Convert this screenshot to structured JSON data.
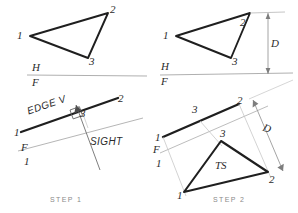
{
  "sheet": {
    "title": "Descriptive geometry construction — true size of an oblique plane",
    "ink_dark": "#1f1f1f",
    "ink_light": "#b6b6b6",
    "ink_label": "#2b2b2b",
    "step_label_color": "#8a8a8a",
    "background": "#ffffff"
  },
  "views": {
    "top_left": {
      "name": "Given top view",
      "vertices": [
        {
          "label": "1",
          "x": 30,
          "y": 36
        },
        {
          "label": "2",
          "x": 108,
          "y": 13
        },
        {
          "label": "3",
          "x": 88,
          "y": 58
        }
      ],
      "fold_line": {
        "label_upper": "H",
        "label_lower": "F"
      }
    },
    "top_right": {
      "name": "Given top view with depth dimension",
      "vertices": [
        {
          "label": "1",
          "x": 176,
          "y": 36
        },
        {
          "label": "2",
          "x": 250,
          "y": 13
        },
        {
          "label": "3",
          "x": 231,
          "y": 58
        }
      ],
      "fold_line": {
        "label_upper": "H",
        "label_lower": "F"
      },
      "dimension": {
        "label": "D",
        "meaning": "depth"
      }
    },
    "bottom_left": {
      "name": "Step 1 — edge view auxiliary",
      "step_label": "STEP 1",
      "annotations": [
        {
          "label": "EDGE V",
          "meaning": "edge view of the plane"
        },
        {
          "label": "SIGHT",
          "meaning": "line of sight direction"
        }
      ],
      "vertices": [
        {
          "label": "1",
          "x": 21,
          "y": 132
        },
        {
          "label": "2",
          "x": 116,
          "y": 99
        },
        {
          "label": "3",
          "x": 83,
          "y": 114
        }
      ],
      "fold_line": {
        "label_upper": "F",
        "label_lower": "1"
      },
      "perpendicular_mark": true
    },
    "bottom_right": {
      "name": "Step 2 — true size auxiliary",
      "step_label": "STEP 2",
      "edge_view_vertices": [
        {
          "label": "1",
          "x": 163,
          "y": 137
        },
        {
          "label": "3",
          "x": 196,
          "y": 119
        },
        {
          "label": "2",
          "x": 236,
          "y": 105
        }
      ],
      "true_size_vertices": [
        {
          "label": "1",
          "x": 184,
          "y": 192
        },
        {
          "label": "3",
          "x": 221,
          "y": 141
        },
        {
          "label": "2",
          "x": 268,
          "y": 172
        }
      ],
      "fold_line": {
        "label_upper": "F",
        "label_lower": "1"
      },
      "dimension": {
        "label": "D",
        "meaning": "depth transferred"
      },
      "true_size_label": "TS"
    }
  }
}
